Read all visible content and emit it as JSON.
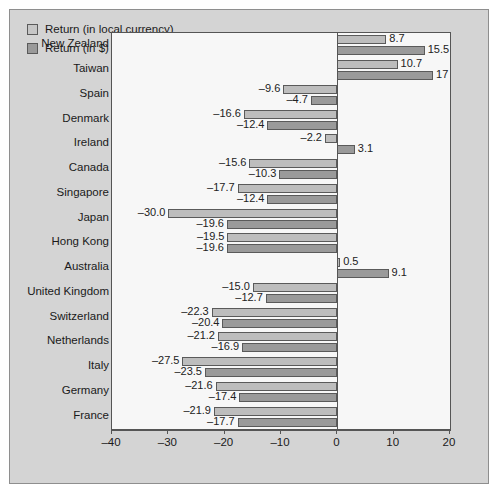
{
  "chart_data": {
    "type": "bar",
    "orientation": "horizontal",
    "title": "",
    "xlabel": "",
    "ylabel": "",
    "xlim": [
      -40,
      20
    ],
    "xticks": [
      -40,
      -30,
      -20,
      -10,
      0,
      10,
      20
    ],
    "xticklabels": [
      "–40",
      "–30",
      "–20",
      "–10",
      "0",
      "10",
      "20"
    ],
    "grid": false,
    "legend_position": "top-left",
    "categories": [
      "New Zealand",
      "Taiwan",
      "Spain",
      "Denmark",
      "Ireland",
      "Canada",
      "Singapore",
      "Japan",
      "Hong Kong",
      "Australia",
      "United Kingdom",
      "Switzerland",
      "Netherlands",
      "Italy",
      "Germany",
      "France"
    ],
    "series": [
      {
        "name": "Return (in local currency)",
        "color": "#bdbdbd",
        "values": [
          8.7,
          10.7,
          -9.6,
          -16.6,
          -2.2,
          -15.6,
          -17.7,
          -30.0,
          -19.5,
          0.5,
          -15.0,
          -22.3,
          -21.2,
          -27.5,
          -21.6,
          -21.9
        ],
        "labels": [
          "8.7",
          "10.7",
          "–9.6",
          "–16.6",
          "–2.2",
          "–15.6",
          "–17.7",
          "–30.0",
          "–19.5",
          "0.5",
          "–15.0",
          "–22.3",
          "–21.2",
          "–27.5",
          "–21.6",
          "–21.9"
        ]
      },
      {
        "name": "Return (in $)",
        "color": "#9a9a9a",
        "values": [
          15.5,
          17.0,
          -4.7,
          -12.4,
          3.1,
          -10.3,
          -12.4,
          -19.6,
          -19.6,
          9.1,
          -12.7,
          -20.4,
          -16.9,
          -23.5,
          -17.4,
          -17.7
        ],
        "labels": [
          "15.5",
          "17",
          "–4.7",
          "–12.4",
          "3.1",
          "–10.3",
          "–12.4",
          "–19.6",
          "–19.6",
          "9.1",
          "–12.7",
          "–20.4",
          "–16.9",
          "–23.5",
          "–17.4",
          "–17.7"
        ]
      }
    ]
  },
  "legend": {
    "items": [
      {
        "label": "Return (in local currency)"
      },
      {
        "label": "Return (in $)"
      }
    ]
  }
}
